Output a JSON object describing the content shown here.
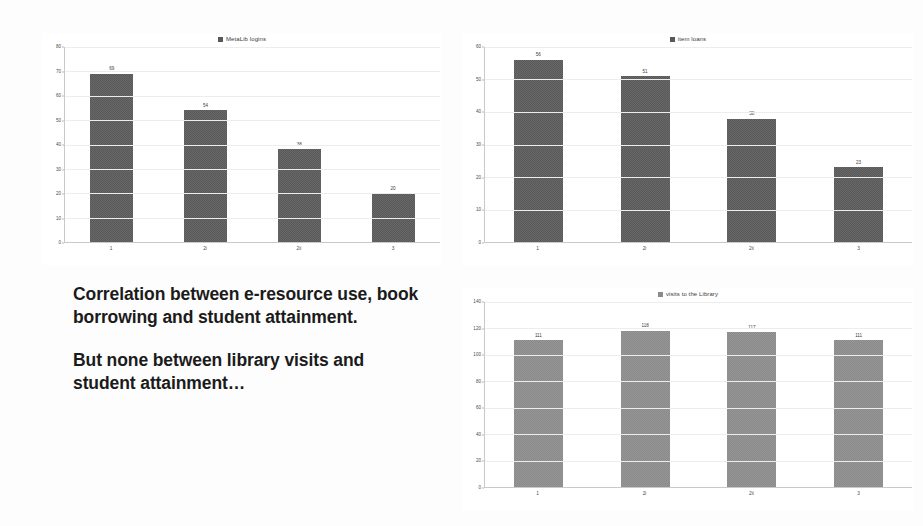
{
  "slide": {
    "background": "#fdfdfd",
    "body_text": [
      "Correlation between e-resource use, book borrowing and student attainment.",
      "But none between library visits and student attainment…"
    ]
  },
  "colors": {
    "bar_dark": "#585858",
    "bar_light": "#8a8a8a",
    "axis": "#c9c9c9",
    "grid": "#ededed",
    "tick_text": "#4a4a4a"
  },
  "chart_data": [
    {
      "id": "metalib",
      "type": "bar",
      "title": "MetaLib logins",
      "legend": [
        "MetaLib logins"
      ],
      "legend_position": "top-center",
      "legend_swatch": "#585858",
      "grid": true,
      "xlabel": "",
      "ylabel": "",
      "categories": [
        "1",
        "2i",
        "2ii",
        "3"
      ],
      "values": [
        69,
        54,
        38,
        20
      ],
      "value_labels": [
        "69",
        "54",
        "38",
        "20"
      ],
      "yticks": [
        0,
        10,
        20,
        30,
        40,
        50,
        60,
        70,
        80
      ],
      "ytick_labels": [
        "0",
        "10",
        "20",
        "30",
        "40",
        "50",
        "60",
        "70",
        "80"
      ],
      "ylim": [
        0,
        80
      ],
      "bar_color": "#585858"
    },
    {
      "id": "loans",
      "type": "bar",
      "title": "item loans",
      "legend": [
        "item loans"
      ],
      "legend_position": "top-center",
      "legend_swatch": "#585858",
      "grid": true,
      "xlabel": "",
      "ylabel": "",
      "categories": [
        "1",
        "2i",
        "2ii",
        "3"
      ],
      "values": [
        56,
        51,
        38,
        23
      ],
      "value_labels": [
        "56",
        "51",
        "38",
        "23"
      ],
      "yticks": [
        0,
        10,
        20,
        30,
        40,
        50,
        60
      ],
      "ytick_labels": [
        "0",
        "10",
        "20",
        "30",
        "40",
        "50",
        "60"
      ],
      "ylim": [
        0,
        60
      ],
      "bar_color": "#585858"
    },
    {
      "id": "visits",
      "type": "bar",
      "title": "visits to the Library",
      "legend": [
        "visits to the Library"
      ],
      "legend_position": "top-center",
      "legend_swatch": "#8a8a8a",
      "grid": true,
      "xlabel": "",
      "ylabel": "",
      "categories": [
        "1",
        "2i",
        "2ii",
        "3"
      ],
      "values": [
        111,
        118,
        117,
        111
      ],
      "value_labels": [
        "111",
        "118",
        "117",
        "111"
      ],
      "yticks": [
        0,
        20,
        40,
        60,
        80,
        100,
        120,
        140
      ],
      "ytick_labels": [
        "0",
        "20",
        "40",
        "60",
        "80",
        "100",
        "120",
        "140"
      ],
      "ylim": [
        0,
        140
      ],
      "bar_color": "#8a8a8a"
    }
  ]
}
